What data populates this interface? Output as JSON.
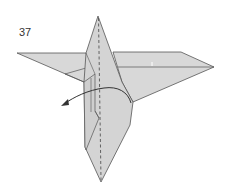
{
  "step": {
    "number": "37"
  },
  "diagram": {
    "paper_color": "#d6d6d6",
    "paper_shade_color": "#c8c8c8",
    "line_color": "#555555",
    "annotations": [
      {
        "type": "valley-fold-line",
        "style": "dashed",
        "orientation": "vertical"
      },
      {
        "type": "arrow",
        "direction": "left",
        "meaning": "fold flap to the left"
      }
    ]
  }
}
